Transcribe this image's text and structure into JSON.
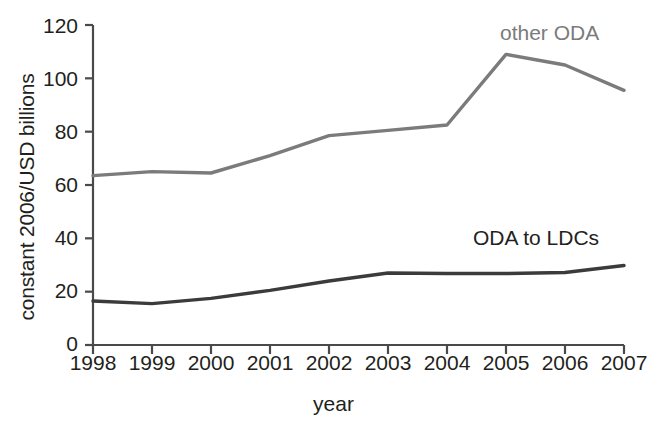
{
  "chart_data": {
    "type": "line",
    "title": "",
    "xlabel": "year",
    "ylabel": "constant 2006/USD billions",
    "x": [
      "1998",
      "1999",
      "2000",
      "2001",
      "2002",
      "2003",
      "2004",
      "2005",
      "2006",
      "2007"
    ],
    "xlim": [
      1998,
      2007
    ],
    "ylim": [
      0,
      120
    ],
    "yticks": [
      0,
      20,
      40,
      60,
      80,
      100,
      120
    ],
    "grid": false,
    "legend_position": "inline-annotation",
    "series": [
      {
        "name": "other ODA",
        "color": "#7b7b7b",
        "values": [
          63.5,
          65.0,
          64.5,
          71.0,
          78.5,
          80.5,
          82.5,
          109.0,
          105.0,
          95.5
        ],
        "label_x": "2005",
        "label_text": "other ODA"
      },
      {
        "name": "ODA to LDCs",
        "color": "#3b3b3b",
        "values": [
          16.5,
          15.5,
          17.5,
          20.5,
          24.0,
          27.0,
          26.8,
          26.8,
          27.2,
          29.8
        ],
        "label_x": "2005",
        "label_text": "ODA to LDCs"
      }
    ]
  },
  "axes": {
    "y_title": "constant 2006/USD billions",
    "x_title": "year",
    "y_tick_labels": [
      "120",
      "100",
      "80",
      "60",
      "40",
      "20",
      "0"
    ],
    "x_tick_labels": [
      "1998",
      "1999",
      "2000",
      "2001",
      "2002",
      "2003",
      "2004",
      "2005",
      "2006",
      "2007"
    ],
    "axis_color": "#4a4a4a"
  },
  "annotations": {
    "other_oda_label": "other ODA",
    "oda_to_ldcs_label": "ODA to LDCs"
  }
}
